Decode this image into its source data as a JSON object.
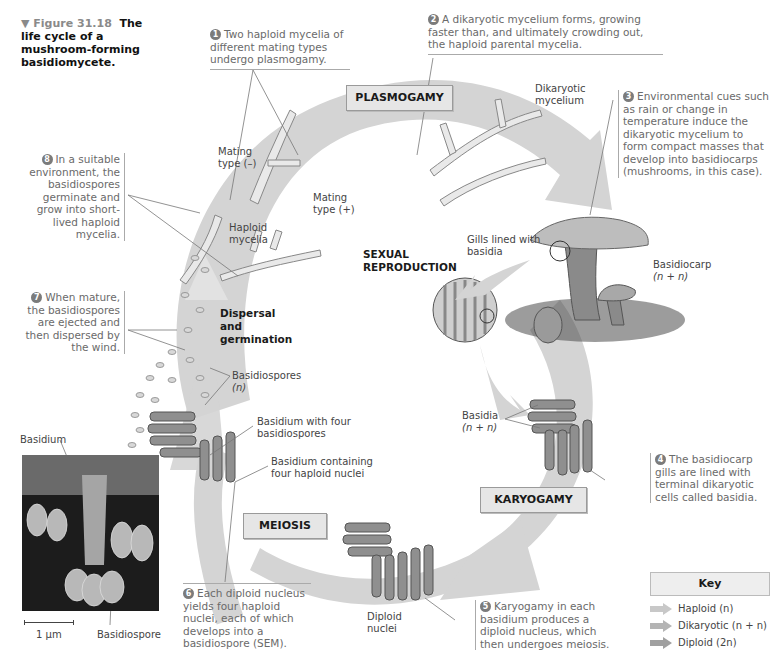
{
  "figure": {
    "marker": "▼ Figure 31.18",
    "title": "The life cycle of a mushroom-forming basidiomycete."
  },
  "stages": {
    "plasmogamy": "PLASMOGAMY",
    "karyogamy": "KARYOGAMY",
    "meiosis": "MEIOSIS",
    "sexual_reproduction": "SEXUAL REPRODUCTION",
    "dispersal": "Dispersal and germination"
  },
  "steps": [
    {
      "number": "1",
      "text": "Two haploid mycelia of different mating types undergo plasmogamy."
    },
    {
      "number": "2",
      "text": "A dikaryotic mycelium forms, growing faster than, and ultimately crowding out, the haploid parental mycelia."
    },
    {
      "number": "3",
      "text": "Environmental cues such as rain or change in temperature induce the dikaryotic mycelium to form compact masses that develop into basidiocarps (mushrooms, in this case)."
    },
    {
      "number": "4",
      "text": "The basidiocarp gills are lined with terminal dikaryotic cells called basidia."
    },
    {
      "number": "5",
      "text": "Karyogamy in each basidium produces a diploid nucleus, which then undergoes meiosis."
    },
    {
      "number": "6",
      "text": "Each diploid nucleus yields four haploid nuclei, each of which develops into a basidiospore (SEM)."
    },
    {
      "number": "7",
      "text": "When mature, the basidiospores are ejected and then dispersed by the wind."
    },
    {
      "number": "8",
      "text": "In a suitable environment, the basidiospores germinate and grow into short-lived haploid mycelia."
    }
  ],
  "labels": {
    "mating_minus": "Mating type (–)",
    "mating_plus": "Mating type (+)",
    "haploid_mycelia": "Haploid mycelia",
    "dikaryotic_mycelium": "Dikaryotic mycelium",
    "gills": "Gills lined with basidia",
    "basidiocarp": "Basidiocarp",
    "basidiocarp_ploidy": "(n + n)",
    "basidia": "Basidia",
    "basidia_ploidy": "(n + n)",
    "basidiospores": "Basidiospores",
    "basidiospores_ploidy": "(n)",
    "basidium_four_spores": "Basidium with four basidiospores",
    "basidium_four_nuclei": "Basidium containing four haploid nuclei",
    "diploid_nuclei": "Diploid nuclei",
    "sem_basidium": "Basidium",
    "sem_basidiospore": "Basidiospore",
    "scale_bar": "1 µm"
  },
  "key": {
    "title": "Key",
    "items": [
      {
        "label": "Haploid (n)",
        "color": "#c8c8c8"
      },
      {
        "label": "Dikaryotic (n + n)",
        "color": "#b4b4b4"
      },
      {
        "label": "Diploid (2n)",
        "color": "#a0a0a0"
      }
    ]
  },
  "colors": {
    "cycle_arrow": "#d4d4d4",
    "stage_box": "#e6e6e6",
    "caption_text": "#6a6a6a",
    "number_badge": "#7b7b7b"
  }
}
